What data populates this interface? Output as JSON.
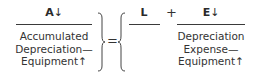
{
  "equation": {
    "assets": {
      "letter": "A",
      "arrow": "↓",
      "lines": [
        "Accumulated",
        "Depreciation—",
        "Equipment↑"
      ]
    },
    "equals": "=",
    "liabilities": {
      "letter": "L"
    },
    "plus": "+",
    "equity": {
      "letter": "E",
      "arrow": "↓",
      "lines": [
        "Depreciation",
        "Expense—",
        "Equipment↑"
      ]
    }
  }
}
